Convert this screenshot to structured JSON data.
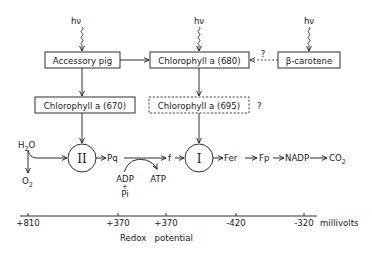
{
  "diagram": {
    "light_inputs": [
      {
        "id": "hv-accessory",
        "label": "hν"
      },
      {
        "id": "hv-chl680",
        "label": "hν"
      },
      {
        "id": "hv-carotene",
        "label": "hν"
      }
    ],
    "boxes": {
      "accessory_pig": "Accessory pig",
      "chlorophyll_680": "Chlorophyll a (680)",
      "beta_carotene": "β-carotene",
      "chlorophyll_670": "Chlorophyll a (670)",
      "chlorophyll_695": "Chlorophyll a (695)"
    },
    "uncertain_marks": {
      "carotene_to_680": "?",
      "chl695": "?"
    },
    "photosystems": {
      "ps2": "II",
      "ps1": "I"
    },
    "chain": {
      "h2o": "H2O",
      "o2": "O2",
      "pq": "Pq",
      "f": "f",
      "fer": "Fer",
      "fp": "Fp",
      "nadp": "NADP",
      "co2": "CO2"
    },
    "phosphorylation": {
      "adp": "ADP",
      "plus": "+",
      "pi": "Pi",
      "atp": "ATP"
    },
    "axis": {
      "ticks": [
        "+810",
        "+370",
        "+370",
        "-420",
        "-320"
      ],
      "unit": "millivolts",
      "title": "Redox   potential"
    }
  }
}
